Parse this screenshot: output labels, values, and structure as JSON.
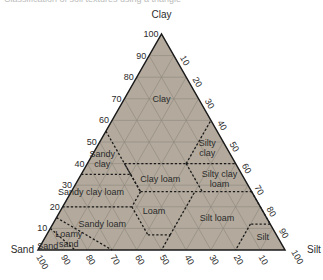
{
  "caption_fragment": "Classification of soil textures using a triangle",
  "chart_data": {
    "type": "ternary",
    "title": "",
    "axes": {
      "clay": {
        "label": "Clay",
        "ticks": [
          10,
          20,
          30,
          40,
          50,
          60,
          70,
          80,
          90,
          100
        ]
      },
      "silt": {
        "label": "Silt",
        "ticks": [
          10,
          20,
          30,
          40,
          50,
          60,
          70,
          80,
          90,
          100
        ]
      },
      "sand": {
        "label": "Sand",
        "ticks": [
          10,
          20,
          30,
          40,
          50,
          60,
          70,
          80,
          90,
          100
        ]
      }
    },
    "grid": true,
    "fill_color": "#b3aa9d",
    "grid_color": "#8f877c",
    "classes": [
      {
        "name": "Clay",
        "label": [
          "Clay"
        ],
        "label_at": {
          "clay": 70,
          "silt": 15
        }
      },
      {
        "name": "Sandy clay",
        "label": [
          "Sandy",
          "clay"
        ],
        "label_at": {
          "clay": 42,
          "silt": 5
        }
      },
      {
        "name": "Silty clay",
        "label": [
          "Silty",
          "clay"
        ],
        "label_at": {
          "clay": 47,
          "silt": 45
        }
      },
      {
        "name": "Clay loam",
        "label": [
          "Clay loam"
        ],
        "label_at": {
          "clay": 33,
          "silt": 33
        }
      },
      {
        "name": "Silty clay loam",
        "label": [
          "Silty clay",
          "loam"
        ],
        "label_at": {
          "clay": 33,
          "silt": 57
        }
      },
      {
        "name": "Sandy clay loam",
        "label": [
          "Sandy clay loam"
        ],
        "label_at": {
          "clay": 27,
          "silt": 8
        }
      },
      {
        "name": "Loam",
        "label": [
          "Loam"
        ],
        "label_at": {
          "clay": 18,
          "silt": 38
        }
      },
      {
        "name": "Sandy loam",
        "label": [
          "Sandy loam"
        ],
        "label_at": {
          "clay": 12,
          "silt": 20
        }
      },
      {
        "name": "Silt loam",
        "label": [
          "Silt loam"
        ],
        "label_at": {
          "clay": 15,
          "silt": 65
        }
      },
      {
        "name": "Silt",
        "label": [
          "Silt"
        ],
        "label_at": {
          "clay": 6,
          "silt": 88
        }
      },
      {
        "name": "Loamy sand",
        "label": [
          "Loamy",
          "sand"
        ],
        "label_at": {
          "clay": 5,
          "silt": 10
        }
      },
      {
        "name": "Sand",
        "label": [
          "Sand"
        ],
        "label_at": {
          "clay": 2,
          "silt": 3
        }
      }
    ]
  }
}
